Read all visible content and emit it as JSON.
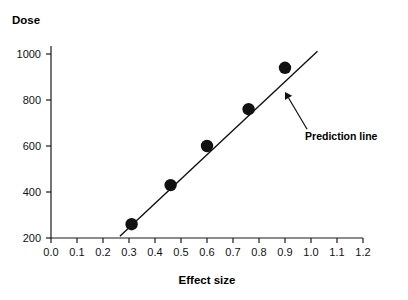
{
  "chart_data": {
    "type": "scatter",
    "title": "",
    "xlabel": "Effect size",
    "ylabel": "Dose",
    "xlim": [
      0.0,
      1.2
    ],
    "ylim": [
      150,
      1060
    ],
    "grid": false,
    "legend": null,
    "x": [
      0.31,
      0.46,
      0.6,
      0.76,
      0.9
    ],
    "y": [
      260,
      430,
      600,
      760,
      940
    ],
    "xticks": [
      "0.0",
      "0.1",
      "0.2",
      "0.3",
      "0.4",
      "0.5",
      "0.6",
      "0.7",
      "0.8",
      "0.9",
      "1.0",
      "1.1",
      "1.2"
    ],
    "xtick_values": [
      0.0,
      0.1,
      0.2,
      0.3,
      0.4,
      0.5,
      0.6,
      0.7,
      0.8,
      0.9,
      1.0,
      1.1,
      1.2
    ],
    "yticks": [
      "200",
      "400",
      "600",
      "800",
      "1000"
    ],
    "ytick_values": [
      200,
      400,
      600,
      800,
      1000
    ],
    "series": [
      {
        "name": "Observed points",
        "type": "scatter",
        "marker": "filled-circle",
        "color": "#111111",
        "points": [
          {
            "x": 0.31,
            "y": 260
          },
          {
            "x": 0.46,
            "y": 430
          },
          {
            "x": 0.6,
            "y": 600
          },
          {
            "x": 0.76,
            "y": 760
          },
          {
            "x": 0.9,
            "y": 940
          }
        ]
      },
      {
        "name": "Prediction line",
        "type": "line",
        "color": "#111111",
        "x_start": 0.265,
        "y_start": 208,
        "x_end": 1.025,
        "y_end": 1012
      }
    ],
    "annotations": [
      {
        "text": "Prediction line",
        "target_x": 0.9,
        "target_y": 835,
        "label_x": 0.985,
        "label_y": 673
      }
    ]
  },
  "axes": {
    "y_axis_title": "Dose",
    "x_axis_title": "Effect size"
  },
  "colors": {
    "ink": "#111111",
    "background": "#ffffff"
  }
}
